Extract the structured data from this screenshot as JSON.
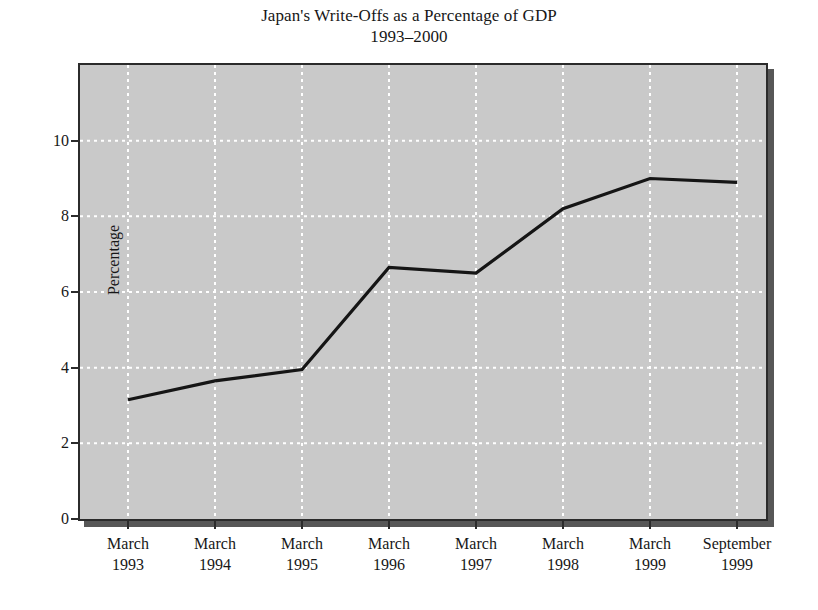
{
  "title": {
    "line1": "Japan's Write-Offs as a Percentage of GDP",
    "line2": "1993–2000"
  },
  "axes": {
    "ylabel": "Percentage",
    "y_ticks": [
      "0",
      "2",
      "4",
      "6",
      "8",
      "10"
    ],
    "x_tick_lines": [
      [
        "March",
        "1993"
      ],
      [
        "March",
        "1994"
      ],
      [
        "March",
        "1995"
      ],
      [
        "March",
        "1996"
      ],
      [
        "March",
        "1997"
      ],
      [
        "March",
        "1998"
      ],
      [
        "March",
        "1999"
      ],
      [
        "September",
        "1999"
      ]
    ]
  },
  "caption": {
    "partial_text": ""
  },
  "colors": {
    "plot_background": "#c9c9c9",
    "plot_border": "#2b2b2b",
    "gridline": "#ffffff",
    "series_line": "#151515",
    "shadow": "#575757",
    "page_background": "#ffffff",
    "text": "#171717"
  },
  "chart_data": {
    "type": "line",
    "title": "Japan's Write-Offs as a Percentage of GDP 1993–2000",
    "xlabel": "",
    "ylabel": "Percentage",
    "categories": [
      "March 1993",
      "March 1994",
      "March 1995",
      "March 1996",
      "March 1997",
      "March 1998",
      "March 1999",
      "September 1999"
    ],
    "values": [
      3.15,
      3.65,
      3.95,
      6.65,
      6.5,
      8.2,
      9.0,
      8.9
    ],
    "ylim": [
      0,
      12
    ],
    "y_ticks": [
      0,
      2,
      4,
      6,
      8,
      10
    ],
    "grid": true,
    "grid_style": "dotted-white",
    "legend": "none",
    "series": [
      {
        "name": "Write-offs as % of GDP",
        "values": [
          3.15,
          3.65,
          3.95,
          6.65,
          6.5,
          8.2,
          9.0,
          8.9
        ]
      }
    ]
  }
}
